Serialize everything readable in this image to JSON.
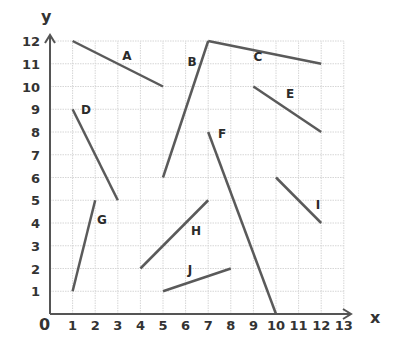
{
  "chart_data": {
    "type": "line",
    "title": "",
    "xlabel": "x",
    "ylabel": "y",
    "origin_label": "0",
    "xlim": [
      0,
      13
    ],
    "ylim": [
      0,
      12
    ],
    "grid": true,
    "x_ticks": [
      "1",
      "2",
      "3",
      "4",
      "5",
      "6",
      "7",
      "8",
      "9",
      "10",
      "11",
      "12",
      "13"
    ],
    "y_ticks": [
      "1",
      "2",
      "3",
      "4",
      "5",
      "6",
      "7",
      "8",
      "9",
      "10",
      "11",
      "12"
    ],
    "segments": [
      {
        "name": "A",
        "from": [
          1,
          12
        ],
        "to": [
          5,
          10
        ],
        "label_pos": [
          127,
          56
        ]
      },
      {
        "name": "B",
        "from": [
          5,
          6
        ],
        "to": [
          7,
          12
        ],
        "label_pos": [
          192,
          62
        ]
      },
      {
        "name": "C",
        "from": [
          7,
          12
        ],
        "to": [
          12,
          11
        ],
        "label_pos": [
          258,
          57
        ]
      },
      {
        "name": "D",
        "from": [
          1,
          9
        ],
        "to": [
          3,
          5
        ],
        "label_pos": [
          86,
          110
        ]
      },
      {
        "name": "E",
        "from": [
          9,
          10
        ],
        "to": [
          12,
          8
        ],
        "label_pos": [
          290,
          94
        ]
      },
      {
        "name": "F",
        "from": [
          7,
          8
        ],
        "to": [
          10,
          0
        ],
        "label_pos": [
          222,
          134
        ]
      },
      {
        "name": "G",
        "from": [
          1,
          1
        ],
        "to": [
          2,
          5
        ],
        "label_pos": [
          102,
          220
        ]
      },
      {
        "name": "H",
        "from": [
          4,
          2
        ],
        "to": [
          7,
          5
        ],
        "label_pos": [
          196,
          231
        ]
      },
      {
        "name": "I",
        "from": [
          10,
          6
        ],
        "to": [
          12,
          4
        ],
        "label_pos": [
          318,
          205
        ]
      },
      {
        "name": "J",
        "from": [
          5,
          1
        ],
        "to": [
          8,
          2
        ],
        "label_pos": [
          190,
          270
        ]
      }
    ],
    "colors": {
      "segment": "#5a5a5a",
      "axis": "#555555",
      "grid": "#d6d6d6",
      "text": "#333333"
    }
  }
}
